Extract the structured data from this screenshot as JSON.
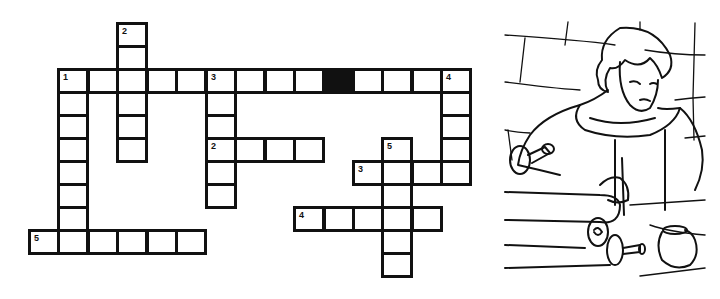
{
  "puzzle": {
    "title": "Crossword puzzle",
    "grid": {
      "origin_x": 28,
      "origin_y": 22,
      "cell_w": 29.45,
      "cell_h": 23
    },
    "colors": {
      "line": "#111111",
      "cell_fill": "#ffffff",
      "block": "#111111"
    },
    "cells": [
      {
        "c": 3,
        "r": 0,
        "n": "2"
      },
      {
        "c": 3,
        "r": 1
      },
      {
        "c": 1,
        "r": 2,
        "n": "1"
      },
      {
        "c": 2,
        "r": 2
      },
      {
        "c": 3,
        "r": 2
      },
      {
        "c": 4,
        "r": 2
      },
      {
        "c": 5,
        "r": 2
      },
      {
        "c": 6,
        "r": 2,
        "n": "3"
      },
      {
        "c": 7,
        "r": 2
      },
      {
        "c": 8,
        "r": 2
      },
      {
        "c": 9,
        "r": 2
      },
      {
        "c": 10,
        "r": 2,
        "black": true
      },
      {
        "c": 11,
        "r": 2
      },
      {
        "c": 12,
        "r": 2
      },
      {
        "c": 13,
        "r": 2
      },
      {
        "c": 14,
        "r": 2,
        "n": "4"
      },
      {
        "c": 1,
        "r": 3
      },
      {
        "c": 3,
        "r": 3
      },
      {
        "c": 6,
        "r": 3
      },
      {
        "c": 14,
        "r": 3
      },
      {
        "c": 1,
        "r": 4
      },
      {
        "c": 3,
        "r": 4
      },
      {
        "c": 6,
        "r": 4
      },
      {
        "c": 14,
        "r": 4
      },
      {
        "c": 1,
        "r": 5
      },
      {
        "c": 3,
        "r": 5
      },
      {
        "c": 6,
        "r": 5,
        "n": "2"
      },
      {
        "c": 7,
        "r": 5
      },
      {
        "c": 8,
        "r": 5
      },
      {
        "c": 9,
        "r": 5
      },
      {
        "c": 12,
        "r": 5,
        "n": "5"
      },
      {
        "c": 14,
        "r": 5
      },
      {
        "c": 1,
        "r": 6
      },
      {
        "c": 6,
        "r": 6
      },
      {
        "c": 11,
        "r": 6,
        "n": "3"
      },
      {
        "c": 12,
        "r": 6
      },
      {
        "c": 13,
        "r": 6
      },
      {
        "c": 14,
        "r": 6
      },
      {
        "c": 1,
        "r": 7
      },
      {
        "c": 6,
        "r": 7
      },
      {
        "c": 12,
        "r": 7
      },
      {
        "c": 1,
        "r": 8
      },
      {
        "c": 9,
        "r": 8,
        "n": "4"
      },
      {
        "c": 10,
        "r": 8
      },
      {
        "c": 11,
        "r": 8
      },
      {
        "c": 12,
        "r": 8
      },
      {
        "c": 13,
        "r": 8
      },
      {
        "c": 0,
        "r": 9,
        "n": "5"
      },
      {
        "c": 1,
        "r": 9
      },
      {
        "c": 2,
        "r": 9
      },
      {
        "c": 3,
        "r": 9
      },
      {
        "c": 4,
        "r": 9
      },
      {
        "c": 5,
        "r": 9
      },
      {
        "c": 12,
        "r": 9
      },
      {
        "c": 12,
        "r": 10
      }
    ],
    "clue_numbers": {
      "across": [
        "1",
        "2",
        "3",
        "4",
        "5"
      ],
      "down": [
        "1",
        "2",
        "3",
        "4",
        "5"
      ]
    }
  },
  "illustration": {
    "subject": "young scribe writing on a scroll at a desk before a stone wall",
    "icons": [
      "scribe-figure-icon",
      "scroll-icon",
      "quill-pen-icon",
      "ink-pot-icon",
      "stone-wall-icon"
    ]
  }
}
